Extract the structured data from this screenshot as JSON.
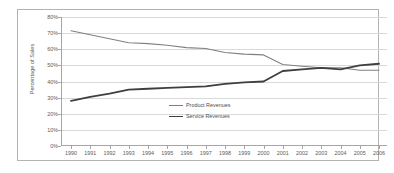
{
  "chart_data": {
    "type": "line",
    "title": "",
    "xlabel": "",
    "ylabel": "Percentage of Sales",
    "ylim": [
      0,
      80
    ],
    "ytick_labels": [
      "80%",
      "70%",
      "60%",
      "50%",
      "40%",
      "30%",
      "20%",
      "10%",
      "0%"
    ],
    "ytick_values": [
      80,
      70,
      60,
      50,
      40,
      30,
      20,
      10,
      0
    ],
    "grid": true,
    "legend_position": "center-inside",
    "categories": [
      "1990",
      "1991",
      "1992",
      "1993",
      "1994",
      "1995",
      "1996",
      "1997",
      "1998",
      "1999",
      "2000",
      "2001",
      "2002",
      "2003",
      "2004",
      "2005",
      "2006"
    ],
    "x": [
      1990,
      1991,
      1992,
      1993,
      1994,
      1995,
      1996,
      1997,
      1998,
      1999,
      2000,
      2001,
      2002,
      2003,
      2004,
      2005,
      2006
    ],
    "series": [
      {
        "name": "Product Revenues",
        "color": "#808080",
        "line_width": 1.1,
        "values": [
          71.5,
          69.0,
          66.5,
          64.0,
          63.5,
          62.5,
          61.0,
          60.5,
          58.0,
          57.0,
          56.5,
          50.5,
          49.5,
          48.5,
          48.5,
          47.0,
          47.0
        ]
      },
      {
        "name": "Service Revenues",
        "color": "#3f3f3f",
        "line_width": 1.8,
        "values": [
          28.0,
          30.5,
          32.5,
          35.0,
          35.5,
          36.0,
          36.5,
          37.0,
          38.5,
          39.5,
          40.0,
          46.5,
          47.5,
          48.5,
          47.5,
          50.0,
          51.0
        ]
      }
    ]
  },
  "legend": {
    "items": [
      {
        "label": "Product Revenues"
      },
      {
        "label": "Service Revenues"
      }
    ]
  },
  "colors": {
    "product_line": "#808080",
    "service_line": "#3f3f3f",
    "gridline": "#d9d9d9",
    "axis": "#a6a6a6",
    "frame_border": "#b3b3b3",
    "text": "#5a5a5a",
    "background": "#ffffff"
  }
}
